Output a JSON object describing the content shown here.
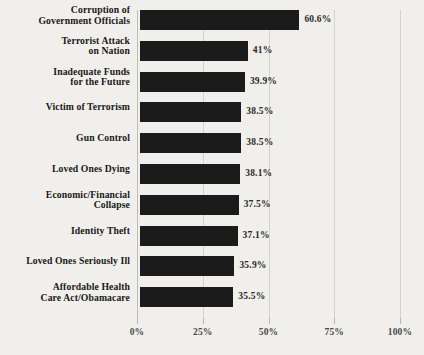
{
  "chart_data": {
    "type": "bar",
    "orientation": "horizontal",
    "title": "",
    "subtitle": "",
    "xlabel": "",
    "ylabel": "",
    "xlim": [
      0,
      100
    ],
    "xticks": [
      "0%",
      "25%",
      "50%",
      "75%",
      "100%"
    ],
    "xtick_values": [
      0,
      25,
      50,
      75,
      100
    ],
    "grid": true,
    "legend": null,
    "bar_color": "#1b1b1b",
    "background_color": "#f0efec",
    "gridline_color": "#d4d2cd",
    "axis_color": "#bfbdb8",
    "categories": [
      "Corruption of\nGovernment Officials",
      "Terrorist Attack\non Nation",
      "Inadequate Funds\nfor the Future",
      "Victim of Terrorism",
      "Gun Control",
      "Loved Ones Dying",
      "Economic/Financial\nCollapse",
      "Identity Theft",
      "Loved Ones Seriously Ill",
      "Affordable Health\nCare Act/Obamacare"
    ],
    "values": [
      60.6,
      41,
      39.9,
      38.5,
      38.5,
      38.1,
      37.5,
      37.1,
      35.9,
      35.5
    ],
    "value_labels": [
      "60.6%",
      "41%",
      "39.9%",
      "38.5%",
      "38.5%",
      "38.1%",
      "37.5%",
      "37.1%",
      "35.9%",
      "35.5%"
    ],
    "label_lines": [
      2,
      2,
      2,
      1,
      1,
      1,
      2,
      1,
      1,
      2
    ]
  }
}
